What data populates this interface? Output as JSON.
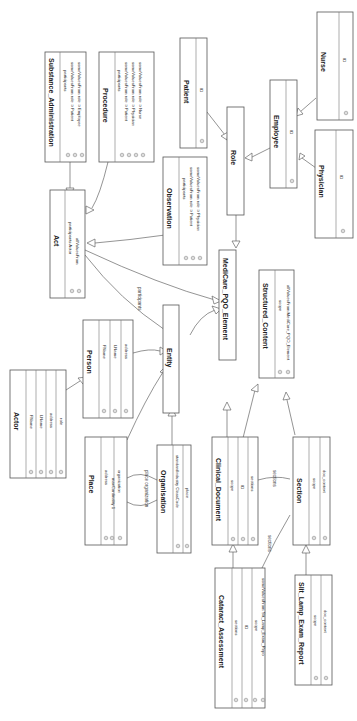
{
  "diagram": {
    "type": "UML class diagram (rotated 90° clockwise)",
    "classes": [
      {
        "id": "substance_administration",
        "name": "Substance_Administration",
        "attributes": [
          "participants",
          "someValuesFrom  role ⊃ Patient",
          "someValuesFrom  role ⊃ Employee"
        ]
      },
      {
        "id": "procedure",
        "name": "Procedure",
        "attributes": [
          "participants",
          "someValuesFrom  role ⊃ Patient",
          "someValuesFrom  role ⊃ Physician",
          "someValuesFrom  role ⊃ Nurse"
        ]
      },
      {
        "id": "patient",
        "name": "Patient",
        "attributes": [
          "ID"
        ]
      },
      {
        "id": "nurse",
        "name": "Nurse",
        "attributes": [
          "ID"
        ]
      },
      {
        "id": "role",
        "name": "Role",
        "attributes": []
      },
      {
        "id": "employee",
        "name": "Employee",
        "attributes": [
          "ID"
        ]
      },
      {
        "id": "physician",
        "name": "Physician",
        "attributes": [
          "ID"
        ]
      },
      {
        "id": "act",
        "name": "Act",
        "attributes": [
          "participants  Actor",
          "allValuesFrom"
        ]
      },
      {
        "id": "observation",
        "name": "Observation",
        "attributes": [
          "participants",
          "someValuesFrom  role ⊃ Patient",
          "someValuesFrom  role ⊃ Physician"
        ]
      },
      {
        "id": "medicare_pqo_element",
        "name": "MediCare_PQO_Element",
        "attributes": []
      },
      {
        "id": "structured_content",
        "name": "Structured_Content",
        "attributes": [
          "scope",
          "allValuesFrom  MediCare_PQO_Element"
        ]
      },
      {
        "id": "actor",
        "name": "Actor",
        "attributes": [
          "FName",
          "LName",
          "address",
          "role"
        ]
      },
      {
        "id": "person",
        "name": "Person",
        "attributes": [
          "FName",
          "LName",
          "address"
        ]
      },
      {
        "id": "entity",
        "name": "Entity",
        "attributes": []
      },
      {
        "id": "place",
        "name": "Place",
        "attributes": [
          "address",
          "maxCardinality  1",
          "organization"
        ]
      },
      {
        "id": "organisation",
        "name": "Organisation",
        "attributes": [
          "standardIndustry ClassCode",
          "place"
        ]
      },
      {
        "id": "clinical_document",
        "name": "Clinical_Document",
        "attributes": [
          "scope",
          "ID",
          "sections"
        ]
      },
      {
        "id": "section",
        "name": "Section",
        "attributes": [
          "scope",
          "doc_context"
        ]
      },
      {
        "id": "cataract_assessment",
        "name": "Cataract_Assessment",
        "attributes": [
          "sections",
          "ID",
          "scope",
          "someValuesFrom  Slit_Lamp_Exam_Repo"
        ]
      },
      {
        "id": "slit_lamp_exam_report",
        "name": "Slit_Lamp_Exam_Report",
        "attributes": [
          "scope",
          "doc_context"
        ]
      }
    ],
    "edge_labels": {
      "participants": "participants",
      "place_organization": "place organization",
      "sections_1": "sections",
      "sections_2": "sections"
    }
  }
}
